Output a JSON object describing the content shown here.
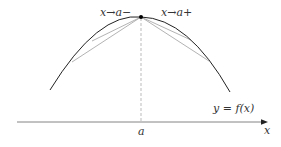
{
  "diagram": {
    "type": "one-sided-derivative-illustration",
    "labels": {
      "left_limit": "x→a−",
      "right_limit": "x→a+",
      "curve": "y = f(x)",
      "point": "a",
      "x_axis": "x"
    },
    "colors": {
      "curve": "#222222",
      "secant": "#999999",
      "axis": "#555555",
      "dashed": "#aaaaaa",
      "point": "#000000",
      "text": "#333333"
    },
    "geometry": {
      "peak": [
        141,
        17
      ],
      "curve_left_end": [
        50,
        90
      ],
      "curve_right_end": [
        230,
        92
      ],
      "axis_y": 122,
      "axis_x_start": 17,
      "axis_x_end": 268
    }
  }
}
